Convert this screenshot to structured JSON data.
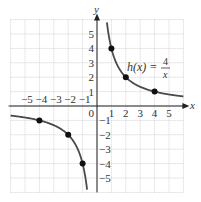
{
  "chart_data": {
    "type": "line",
    "title": "",
    "function_label": {
      "name": "h(x)",
      "equals": "=",
      "numerator": "4",
      "denominator": "x"
    },
    "xlabel": "x",
    "ylabel": "y",
    "xlim": [
      -6,
      6
    ],
    "ylim": [
      -6,
      6
    ],
    "grid": true,
    "x_ticks": [
      "−5",
      "−4",
      "−3",
      "−2",
      "−1",
      "0",
      "1",
      "2",
      "3",
      "4",
      "5"
    ],
    "y_ticks_pos": [
      "1",
      "2",
      "3",
      "4",
      "5"
    ],
    "y_ticks_neg": [
      "−1",
      "−2",
      "−3",
      "−4",
      "−5"
    ],
    "series": [
      {
        "name": "h(x) = 4/x",
        "points": [
          {
            "x": 1,
            "y": 4
          },
          {
            "x": 2,
            "y": 2
          },
          {
            "x": 4,
            "y": 1
          },
          {
            "x": -1,
            "y": -4
          },
          {
            "x": -2,
            "y": -2
          },
          {
            "x": -4,
            "y": -1
          }
        ]
      }
    ],
    "colors": {
      "curve": "#4a4a4a",
      "grid": "#c8c8c8",
      "axis": "#222222",
      "point": "#111111"
    }
  }
}
